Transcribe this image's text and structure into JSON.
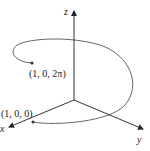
{
  "diagram": {
    "type": "3d-helix",
    "axes": {
      "x_label": "x",
      "y_label": "y",
      "z_label": "z"
    },
    "points": {
      "start_label": "(1, 0, 0)",
      "end_label": "(1, 0, 2π)"
    },
    "colors": {
      "axis": "#333333",
      "curve": "#555555",
      "point": "#333333"
    }
  }
}
